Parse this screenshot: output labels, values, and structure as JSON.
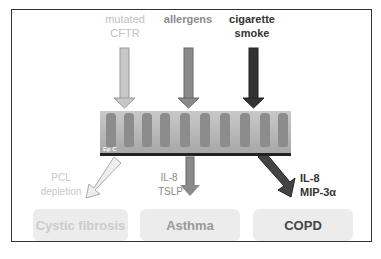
{
  "inputs": [
    {
      "label": "mutated CFTR",
      "color": "#c0c0c0"
    },
    {
      "label": "allergens",
      "color": "#8a8a8a"
    },
    {
      "label": "cigarette smoke",
      "color": "#333333"
    }
  ],
  "epithelium": {
    "label": "Ep C"
  },
  "mediators": [
    {
      "label": "PCL depletion",
      "color": "#c8c8c8"
    },
    {
      "label": "IL-8 TSLP",
      "color": "#8a8a8a"
    },
    {
      "label": "IL-8 MIP-3α",
      "color": "#333333"
    }
  ],
  "diseases": [
    {
      "label": "Cystic fibrosis",
      "color": "#cccccc"
    },
    {
      "label": "Asthma",
      "color": "#9a9a9a"
    },
    {
      "label": "COPD",
      "color": "#444444"
    }
  ]
}
